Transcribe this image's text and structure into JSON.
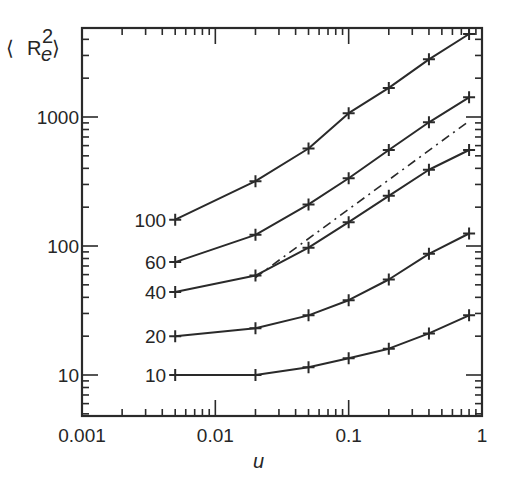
{
  "chart_data": {
    "type": "line",
    "title": "",
    "xlabel": "u",
    "ylabel": "⟨R_e^2⟩",
    "xscale": "log",
    "yscale": "log",
    "xlim": [
      0.001,
      1
    ],
    "ylim": [
      5,
      5000
    ],
    "grid": false,
    "x_ticks": [
      "0.001",
      "0.01",
      "0.1",
      "1"
    ],
    "y_ticks": [
      "10",
      "100",
      "1000"
    ],
    "x": [
      0.005,
      0.02,
      0.05,
      0.1,
      0.2,
      0.4,
      0.8
    ],
    "series": [
      {
        "name": "100",
        "label": "100",
        "values": [
          160,
          318,
          570,
          1070,
          1680,
          2800,
          4400
        ]
      },
      {
        "name": "60",
        "label": "60",
        "values": [
          75,
          122,
          210,
          335,
          555,
          910,
          1420
        ]
      },
      {
        "name": "40",
        "label": "40",
        "values": [
          44,
          59,
          97,
          153,
          245,
          390,
          555
        ]
      },
      {
        "name": "20",
        "label": "20",
        "values": [
          20,
          23,
          29,
          38,
          55,
          87,
          125
        ]
      },
      {
        "name": "10",
        "label": "10",
        "values": [
          10,
          10,
          11.5,
          13.5,
          16,
          21,
          29
        ]
      }
    ],
    "reference_line": {
      "style": "dash-dot",
      "x": [
        0.02,
        0.8
      ],
      "values": [
        57,
        930
      ]
    }
  },
  "axes": {
    "x_title": "u",
    "y_title_main": "R",
    "y_title_sub": "e",
    "y_title_sup": "2"
  }
}
